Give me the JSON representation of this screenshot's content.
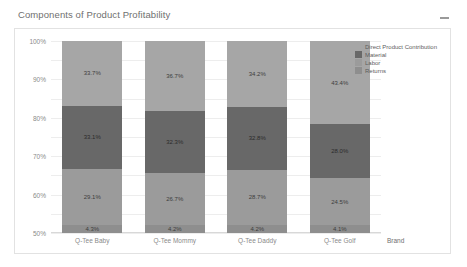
{
  "card": {
    "title": "Components of Product Profitability",
    "collapse_icon": "minimize-icon"
  },
  "chart_data": {
    "type": "bar",
    "stacked": true,
    "stack_mode": "percent",
    "title": "Components of Product Profitability",
    "xlabel": "Brand",
    "ylabel": "",
    "ylim": [
      0,
      100
    ],
    "ytick_labels": [
      "100%",
      "90%",
      "80%",
      "70%",
      "60%",
      "50%",
      "40%",
      "30%",
      "20%",
      "10%",
      "0%"
    ],
    "ytick_values": [
      100,
      90,
      80,
      70,
      60,
      50,
      40,
      30,
      20,
      10,
      0
    ],
    "grid": true,
    "legend_position": "right",
    "categories": [
      "Q-Tee Baby",
      "Q-Tee Mommy",
      "Q-Tee Daddy",
      "Q-Tee Golf"
    ],
    "series": [
      {
        "name": "Direct Product Contribution",
        "color": "#a6a6a6",
        "values": [
          33.7,
          36.7,
          34.2,
          43.4
        ],
        "labels": [
          "33.7%",
          "36.7%",
          "34.2%",
          "43.4%"
        ]
      },
      {
        "name": "Material",
        "color": "#686868",
        "values": [
          33.1,
          32.3,
          32.8,
          28.0
        ],
        "labels": [
          "33.1%",
          "32.3%",
          "32.8%",
          "28.0%"
        ]
      },
      {
        "name": "Labor",
        "color": "#9b9b9b",
        "values": [
          29.1,
          26.7,
          28.7,
          24.5
        ],
        "labels": [
          "29.1%",
          "26.7%",
          "28.7%",
          "24.5%"
        ]
      },
      {
        "name": "Returns",
        "color": "#8e8e8e",
        "values": [
          4.3,
          4.2,
          4.2,
          4.1
        ],
        "labels": [
          "4.3%",
          "4.2%",
          "4.2%",
          "4.1%"
        ]
      }
    ]
  }
}
